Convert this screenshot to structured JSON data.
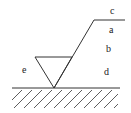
{
  "diagram": {
    "labels": {
      "a": "a",
      "b": "b",
      "c": "c",
      "d": "d",
      "e": "e"
    },
    "stroke_color": "#333333"
  }
}
